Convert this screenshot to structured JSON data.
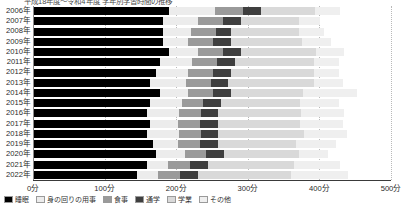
{
  "title": {
    "text": "平成18年度〜令和4年度 学年別学習時間の推移",
    "clipped": true
  },
  "axis": {
    "x_ticks": [
      "0分",
      "100分",
      "200分",
      "300分",
      "400分",
      "500分"
    ],
    "x_tick_values": [
      0,
      100,
      200,
      300,
      400,
      500
    ],
    "x_unit": "分",
    "xmin": 0,
    "xmax": 500,
    "grid": "dotted-vertical"
  },
  "colors": {
    "seg1": "#000000",
    "seg2": "#ececec",
    "seg3": "#9a9a9a",
    "seg4": "#3f3f3f",
    "seg5": "#d9d9d9",
    "seg6": "#efefef",
    "grid": "#b9b9b9",
    "axis": "#3a3a3a",
    "text": "#2b2b2b"
  },
  "legend": {
    "position": "bottom",
    "clipped": true,
    "items": [
      {
        "label": "睡眠",
        "color": "#000000"
      },
      {
        "label": "身の回りの用事",
        "color": "#ececec"
      },
      {
        "label": "食事",
        "color": "#9a9a9a"
      },
      {
        "label": "通学",
        "color": "#3f3f3f"
      },
      {
        "label": "学業",
        "color": "#d9d9d9"
      },
      {
        "label": "その他",
        "color": "#efefef"
      }
    ]
  },
  "chart_data": {
    "type": "bar",
    "orientation": "horizontal",
    "stacked": true,
    "title": "平成18年度〜令和4年度 学年別学習時間の推移",
    "xlabel": "",
    "ylabel": "",
    "xlim": [
      0,
      500
    ],
    "categories": [
      "2006年",
      "2007年",
      "2008年",
      "2009年",
      "2010年",
      "2011年",
      "2012年",
      "2013年",
      "2014年",
      "2015年",
      "2016年",
      "2017年",
      "2018年",
      "2019年",
      "2020年",
      "2021年",
      "2022年"
    ],
    "series": [
      {
        "name": "睡眠",
        "color": "#000000",
        "values": [
          190,
          181,
          181,
          181,
          190,
          177,
          172,
          163,
          177,
          163,
          159,
          163,
          159,
          168,
          172,
          159,
          145
        ]
      },
      {
        "name": "身の回りの用事",
        "color": "#ececec",
        "values": [
          64,
          50,
          40,
          35,
          40,
          45,
          45,
          50,
          40,
          45,
          45,
          40,
          45,
          35,
          40,
          30,
          30
        ]
      },
      {
        "name": "食事",
        "color": "#9a9a9a",
        "values": [
          40,
          35,
          35,
          35,
          35,
          35,
          35,
          35,
          35,
          30,
          30,
          30,
          30,
          30,
          30,
          30,
          30
        ]
      },
      {
        "name": "通学",
        "color": "#3f3f3f",
        "values": [
          25,
          25,
          20,
          25,
          25,
          25,
          25,
          25,
          25,
          25,
          25,
          25,
          25,
          25,
          25,
          25,
          25
        ]
      },
      {
        "name": "学業",
        "color": "#d9d9d9",
        "values": [
          75,
          80,
          95,
          100,
          105,
          110,
          115,
          120,
          100,
          110,
          115,
          115,
          120,
          110,
          105,
          120,
          130
        ]
      },
      {
        "name": "その他",
        "color": "#efefef",
        "values": [
          35,
          30,
          35,
          40,
          40,
          35,
          35,
          40,
          75,
          55,
          60,
          60,
          60,
          55,
          40,
          65,
          80
        ]
      }
    ],
    "rows": [
      {
        "label": "2006年",
        "segments": [
          190,
          64,
          40,
          25,
          75,
          35
        ]
      },
      {
        "label": "2007年",
        "segments": [
          181,
          50,
          35,
          25,
          80,
          30
        ]
      },
      {
        "label": "2008年",
        "segments": [
          181,
          40,
          35,
          20,
          95,
          35
        ]
      },
      {
        "label": "2009年",
        "segments": [
          181,
          35,
          35,
          25,
          100,
          40
        ]
      },
      {
        "label": "2010年",
        "segments": [
          190,
          40,
          35,
          25,
          105,
          40
        ]
      },
      {
        "label": "2011年",
        "segments": [
          177,
          45,
          35,
          25,
          110,
          35
        ]
      },
      {
        "label": "2012年",
        "segments": [
          172,
          45,
          35,
          25,
          115,
          35
        ]
      },
      {
        "label": "2013年",
        "segments": [
          163,
          50,
          35,
          25,
          120,
          40
        ]
      },
      {
        "label": "2014年",
        "segments": [
          177,
          40,
          35,
          25,
          100,
          75
        ]
      },
      {
        "label": "2015年",
        "segments": [
          163,
          45,
          30,
          25,
          110,
          55
        ]
      },
      {
        "label": "2016年",
        "segments": [
          159,
          45,
          30,
          25,
          115,
          60
        ]
      },
      {
        "label": "2017年",
        "segments": [
          163,
          40,
          30,
          25,
          115,
          60
        ]
      },
      {
        "label": "2018年",
        "segments": [
          159,
          45,
          30,
          25,
          120,
          60
        ]
      },
      {
        "label": "2019年",
        "segments": [
          168,
          35,
          30,
          25,
          110,
          55
        ]
      },
      {
        "label": "2020年",
        "segments": [
          172,
          40,
          30,
          25,
          105,
          40
        ]
      },
      {
        "label": "2021年",
        "segments": [
          159,
          30,
          30,
          25,
          120,
          65
        ]
      },
      {
        "label": "2022年",
        "segments": [
          145,
          30,
          30,
          25,
          130,
          80
        ]
      }
    ]
  }
}
